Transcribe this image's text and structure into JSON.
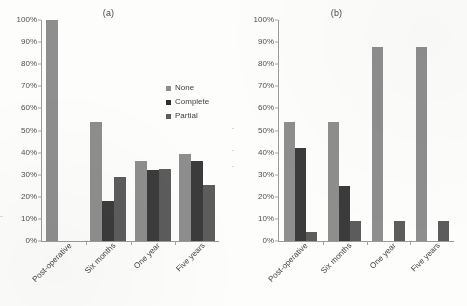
{
  "chart_data": [
    {
      "type": "bar",
      "title": "(a)",
      "xlabel": "",
      "ylabel": "",
      "ylim": [
        0,
        100
      ],
      "ytick_labels": [
        "0%",
        "10%",
        "20%",
        "30%",
        "40%",
        "50%",
        "60%",
        "70%",
        "80%",
        "90%",
        "100%"
      ],
      "yticks": [
        0,
        10,
        20,
        30,
        40,
        50,
        60,
        70,
        80,
        90,
        100
      ],
      "grid": false,
      "legend_position": "inside-upper-right",
      "categories": [
        "Post-operative",
        "Six months",
        "One year",
        "Five years"
      ],
      "series": [
        {
          "name": "None",
          "color": "#8e8e8e",
          "values": [
            100,
            54,
            36,
            39.5
          ]
        },
        {
          "name": "Complete",
          "color": "#3b3b3b",
          "values": [
            0,
            18,
            32,
            36
          ]
        },
        {
          "name": "Partial",
          "color": "#5c5c5c",
          "values": [
            0,
            29,
            32.5,
            25.5
          ]
        }
      ]
    },
    {
      "type": "bar",
      "title": "(b)",
      "xlabel": "",
      "ylabel": "",
      "ylim": [
        0,
        100
      ],
      "ytick_labels": [
        "0%",
        "10%",
        "20%",
        "30%",
        "40%",
        "50%",
        "60%",
        "70%",
        "80%",
        "90%",
        "100%"
      ],
      "yticks": [
        0,
        10,
        20,
        30,
        40,
        50,
        60,
        70,
        80,
        90,
        100
      ],
      "grid": false,
      "legend_position": "none",
      "categories": [
        "Post-operative",
        "Six months",
        "One year",
        "Five years"
      ],
      "series": [
        {
          "name": "None",
          "color": "#8e8e8e",
          "values": [
            54,
            54,
            88,
            88
          ]
        },
        {
          "name": "Complete",
          "color": "#3b3b3b",
          "values": [
            42,
            25,
            0,
            0
          ]
        },
        {
          "name": "Partial",
          "color": "#5c5c5c",
          "values": [
            4,
            9,
            9,
            9
          ]
        }
      ]
    }
  ],
  "legend": {
    "items": [
      {
        "label": "None"
      },
      {
        "label": "Complete"
      },
      {
        "label": "Partial"
      }
    ]
  }
}
